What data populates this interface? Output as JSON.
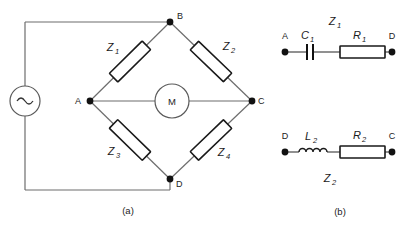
{
  "figure": {
    "panel_a": {
      "caption": "(a)",
      "source_symbol": "ac-source-sine",
      "meter_label": "M",
      "nodes": [
        {
          "id": "A",
          "label": "A"
        },
        {
          "id": "B",
          "label": "B"
        },
        {
          "id": "C",
          "label": "C"
        },
        {
          "id": "D",
          "label": "D"
        }
      ],
      "impedances": [
        {
          "id": "Z1",
          "label": "Z",
          "sub": "1",
          "branch": "A-B"
        },
        {
          "id": "Z2",
          "label": "Z",
          "sub": "2",
          "branch": "B-C"
        },
        {
          "id": "Z3",
          "label": "Z",
          "sub": "3",
          "branch": "A-D"
        },
        {
          "id": "Z4",
          "label": "Z",
          "sub": "4",
          "branch": "D-C"
        }
      ]
    },
    "panel_b": {
      "caption": "(b)",
      "branches": [
        {
          "id": "Z1-detail",
          "title": "Z",
          "title_sub": "1",
          "left_node": "A",
          "right_node": "D",
          "components": [
            {
              "type": "capacitor",
              "label": "C",
              "sub": "1"
            },
            {
              "type": "resistor",
              "label": "R",
              "sub": "1"
            }
          ]
        },
        {
          "id": "Z2-detail",
          "title": "Z",
          "title_sub": "2",
          "left_node": "D",
          "right_node": "C",
          "components": [
            {
              "type": "inductor",
              "label": "L",
              "sub": "2"
            },
            {
              "type": "resistor",
              "label": "R",
              "sub": "2"
            }
          ]
        }
      ]
    },
    "colors": {
      "wire": "#6d6d6d",
      "component_outline": "#1a1a1a",
      "node_dot": "#111111",
      "background": "#ffffff",
      "text": "#1c1c1c"
    }
  }
}
